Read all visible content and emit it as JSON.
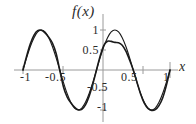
{
  "figure": {
    "title": "f(x)",
    "axis_label_x": "x",
    "background": "#ffffff",
    "curve_color": "#1a1a1a",
    "axis_color": "#9a9a9a"
  },
  "axes": {
    "x_ticks": [
      {
        "id": "xt--1",
        "label": "-1"
      },
      {
        "id": "xt--0p5",
        "label": "-0.5"
      },
      {
        "id": "xt-0p5",
        "label": "0.5"
      },
      {
        "id": "xt-1",
        "label": "1"
      }
    ],
    "y_ticks": [
      {
        "id": "yt-1",
        "label": "1"
      },
      {
        "id": "yt-0p5",
        "label": "0.5"
      },
      {
        "id": "yt--0p5",
        "label": "-0.5"
      },
      {
        "id": "yt--1",
        "label": "-1"
      }
    ]
  },
  "chart_data": {
    "type": "line",
    "title": "f(x)",
    "xlabel": "x",
    "ylabel": "f(x)",
    "xlim": [
      -1.0,
      1.0
    ],
    "ylim": [
      -1.15,
      1.15
    ],
    "grid": false,
    "legend": "none",
    "x_ticks": [
      -1,
      -0.5,
      0.5,
      1
    ],
    "y_ticks": [
      1,
      0.5,
      -0.5,
      -1
    ],
    "series": [
      {
        "name": "sine wave",
        "color": "#1a1a1a",
        "x": [
          -1.0,
          -0.95,
          -0.9,
          -0.85,
          -0.8,
          -0.75,
          -0.7,
          -0.65,
          -0.6,
          -0.55,
          -0.5,
          -0.45,
          -0.4,
          -0.35,
          -0.3,
          -0.25,
          -0.2,
          -0.15,
          -0.1,
          -0.05,
          0.0,
          0.05,
          0.1,
          0.15,
          0.2,
          0.25,
          0.3,
          0.35,
          0.4,
          0.45,
          0.5,
          0.55,
          0.6,
          0.65,
          0.7,
          0.75,
          0.8,
          0.85,
          0.9,
          0.95,
          1.0
        ],
        "y": [
          0.0,
          0.309,
          0.588,
          0.809,
          0.951,
          1.0,
          0.951,
          0.809,
          0.588,
          0.309,
          0.0,
          -0.309,
          -0.588,
          -0.809,
          -0.951,
          -1.0,
          -0.951,
          -0.809,
          -0.588,
          -0.309,
          0.0,
          0.309,
          0.588,
          0.809,
          0.951,
          1.0,
          0.951,
          0.809,
          0.588,
          0.309,
          0.0,
          -0.309,
          -0.588,
          -0.809,
          -0.951,
          -1.0,
          -0.951,
          -0.809,
          -0.588,
          -0.309,
          0.0
        ]
      },
      {
        "name": "approximation",
        "color": "#1a1a1a",
        "x": [
          -1.0,
          -0.95,
          -0.9,
          -0.85,
          -0.8,
          -0.75,
          -0.7,
          -0.65,
          -0.6,
          -0.55,
          -0.5,
          -0.45,
          -0.4,
          -0.35,
          -0.3,
          -0.25,
          -0.2,
          -0.15,
          -0.1,
          -0.05,
          0.0,
          0.05,
          0.1,
          0.15,
          0.2,
          0.25,
          0.3,
          0.35,
          0.4,
          0.45,
          0.5,
          0.55,
          0.6,
          0.65,
          0.7,
          0.75,
          0.8,
          0.85,
          0.9,
          0.95,
          1.0
        ],
        "y": [
          0.0,
          0.352,
          0.655,
          0.872,
          0.983,
          0.995,
          0.93,
          0.82,
          0.676,
          0.42,
          0.0,
          -0.42,
          -0.676,
          -0.82,
          -0.93,
          -0.995,
          -0.983,
          -0.872,
          -0.655,
          -0.352,
          0.0,
          0.352,
          0.619,
          0.718,
          0.715,
          0.69,
          0.68,
          0.62,
          0.47,
          0.25,
          0.0,
          -0.3,
          -0.6,
          -0.83,
          -0.96,
          -1.01,
          -0.99,
          -0.89,
          -0.7,
          -0.39,
          0.0
        ]
      }
    ]
  }
}
